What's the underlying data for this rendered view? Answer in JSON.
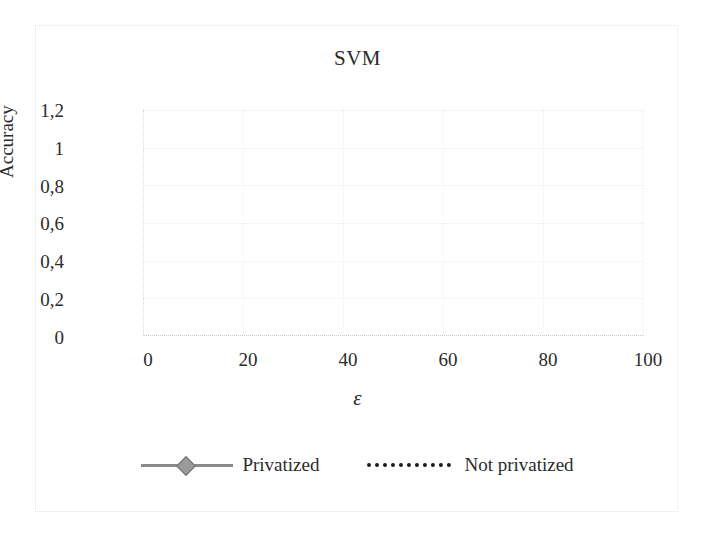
{
  "chart_data": {
    "type": "line",
    "title": "SVM",
    "xlabel": "ε",
    "ylabel": "Accuracy",
    "xlim": [
      0,
      100
    ],
    "ylim": [
      0,
      1.2
    ],
    "grid": true,
    "legend_position": "bottom",
    "x_ticks": [
      "0",
      "20",
      "40",
      "60",
      "80",
      "100"
    ],
    "x_tick_values": [
      0,
      20,
      40,
      60,
      80,
      100
    ],
    "y_ticks": [
      "0",
      "0,2",
      "0,4",
      "0,6",
      "0,8",
      "1",
      "1,2"
    ],
    "y_tick_values": [
      0,
      0.2,
      0.4,
      0.6,
      0.8,
      1.0,
      1.2
    ],
    "decimal_separator": ",",
    "series": [
      {
        "name": "Privatized",
        "color": "#8a8a8a",
        "marker": "diamond",
        "linestyle": "solid",
        "x": [
          0.1,
          0.5,
          1,
          2,
          3,
          4,
          5,
          6,
          7,
          8,
          9,
          10,
          20,
          30,
          40,
          50,
          60,
          70,
          80,
          90,
          100
        ],
        "values": [
          0.33,
          0.57,
          0.52,
          0.85,
          0.93,
          0.96,
          0.97,
          0.98,
          0.985,
          0.985,
          0.99,
          0.99,
          0.99,
          0.99,
          0.99,
          0.99,
          0.99,
          0.99,
          0.99,
          0.99,
          0.99
        ]
      },
      {
        "name": "Not privatized",
        "color": "#1c1c1c",
        "marker": "none",
        "linestyle": "dotted",
        "x": [
          0,
          10,
          20,
          30,
          40,
          50,
          60,
          70,
          80,
          90,
          100
        ],
        "values": [
          1.0,
          1.0,
          1.0,
          1.0,
          1.0,
          1.0,
          1.0,
          1.0,
          1.0,
          1.0,
          1.0
        ]
      }
    ]
  },
  "legend": {
    "items": [
      {
        "label": "Privatized"
      },
      {
        "label": "Not privatized"
      }
    ]
  }
}
